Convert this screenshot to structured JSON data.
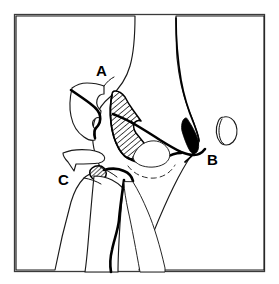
{
  "figure": {
    "kind": "line-art anatomical diagram",
    "background_color": "#ffffff",
    "ink_color": "#000000",
    "frame_color": "#3a3a3a",
    "width": 279,
    "height": 284
  },
  "frame": {
    "name": "figure-border",
    "x": 14,
    "y": 14,
    "width": 251,
    "height": 258
  },
  "labels": [
    {
      "id": "A",
      "text": "A",
      "x": 96,
      "y": 76,
      "note": "upper displaced fragment"
    },
    {
      "id": "B",
      "text": "B",
      "x": 207,
      "y": 165,
      "note": "small isolated ossicle at right"
    },
    {
      "id": "C",
      "text": "C",
      "x": 58,
      "y": 185,
      "note": "lower thin flake fragment"
    }
  ],
  "shapes": {
    "humerus_left_label": "left cortical shaft outline",
    "humerus_right_label": "right cortical shaft outline",
    "fragment_a_label": "upper free fragment outline",
    "fragment_hatched_label": "hatched displaced fragment",
    "fragment_c_label": "thin flake fragment",
    "ossicle_b_label": "small oval ossicle",
    "ulna_label": "ulna shaft outline",
    "radius_label": "radius shaft outline",
    "dashed_label": "dashed joint contour"
  },
  "legend": {
    "hatch_meaning": "hatched = displaced bone fragment",
    "solid_meaning": "solid black = dense cortical sliver"
  }
}
